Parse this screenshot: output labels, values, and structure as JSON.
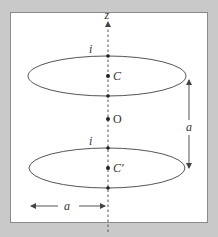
{
  "figure": {
    "axis_label": "z",
    "top_loop": {
      "current_label": "i",
      "center_label": "C"
    },
    "origin_label": "O",
    "bottom_loop": {
      "current_label": "i",
      "center_label": "C′"
    },
    "separation_label": "a",
    "radius_label": "a"
  },
  "colors": {
    "background": "#c9c9c9",
    "panel": "#ffffff",
    "stroke": "#555555"
  }
}
